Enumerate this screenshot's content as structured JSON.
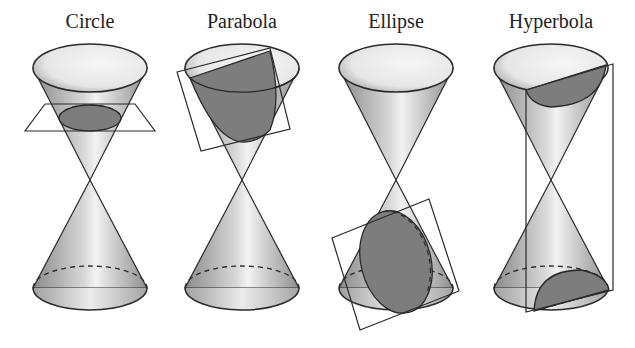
{
  "panels": [
    {
      "label": "Circle",
      "center_x": 90
    },
    {
      "label": "Parabola",
      "center_x": 242
    },
    {
      "label": "Ellipse",
      "center_x": 396
    },
    {
      "label": "Hyperbola",
      "center_x": 551
    }
  ],
  "colors": {
    "background": "#ffffff",
    "outline": "#2a2a2a",
    "cone_light": "#f4f4f4",
    "cone_mid": "#bdbdbd",
    "cone_dark": "#8e8e8e",
    "section_fill": "#7d7d7d",
    "label_text": "#222222"
  }
}
